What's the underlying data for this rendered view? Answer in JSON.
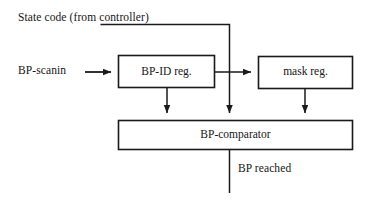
{
  "diagram": {
    "type": "block-diagram",
    "canvas": {
      "width": 369,
      "height": 200,
      "background": "#ffffff"
    },
    "stroke_color": "#1a1a1a",
    "labels": {
      "state_code": "State code (from controller)",
      "bp_scanin": "BP-scanin",
      "bp_reached": "BP reached"
    },
    "blocks": [
      {
        "id": "bp-id-reg",
        "label": "BP-ID reg.",
        "x": 118,
        "y": 55,
        "width": 97,
        "height": 33
      },
      {
        "id": "mask-reg",
        "label": "mask reg.",
        "x": 258,
        "y": 56,
        "width": 95,
        "height": 33
      },
      {
        "id": "bp-comparator",
        "label": "BP-comparator",
        "x": 118,
        "y": 120,
        "width": 235,
        "height": 30
      }
    ],
    "connections": [
      {
        "id": "scanin-to-bp-id-reg",
        "from": "BP-scanin",
        "to": "BP-ID reg.",
        "arrow": true
      },
      {
        "id": "state-code-to-comparator",
        "from": "State code (from controller)",
        "to": "BP-comparator",
        "arrow": true
      },
      {
        "id": "bp-id-reg-to-mask-reg",
        "from": "BP-ID reg.",
        "to": "mask reg.",
        "arrow": true
      },
      {
        "id": "bp-id-reg-to-comparator",
        "from": "BP-ID reg.",
        "to": "BP-comparator",
        "arrow": true
      },
      {
        "id": "mask-reg-to-comparator",
        "from": "mask reg.",
        "to": "BP-comparator",
        "arrow": true
      },
      {
        "id": "comparator-to-bp-reached",
        "from": "BP-comparator",
        "to": "BP reached",
        "arrow": false
      }
    ]
  }
}
